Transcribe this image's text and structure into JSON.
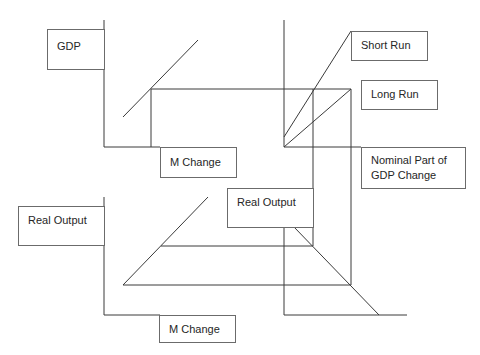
{
  "diagram": {
    "title": "",
    "stroke_color": "#3a3a3a",
    "box_border_color": "#6b6b6b",
    "labels": {
      "gdp": "GDP",
      "m_change_top": "M Change",
      "short_run": "Short Run",
      "long_run": "Long Run",
      "nominal_line1": "Nominal Part of",
      "nominal_line2": "GDP Change",
      "real_output_mid": "Real Output",
      "real_output_left": "Real Output",
      "m_change_bottom": "M Change"
    },
    "panels": [
      {
        "name": "top-left",
        "y_axis": "GDP",
        "x_axis": "M Change"
      },
      {
        "name": "top-right",
        "curves": [
          "Short Run",
          "Long Run"
        ],
        "x_axis": "Nominal Part of GDP Change"
      },
      {
        "name": "bottom-left",
        "y_axis": "Real Output",
        "x_axis": "M Change"
      },
      {
        "name": "bottom-right",
        "y_axis": "Real Output",
        "curve": "45-degree mapping"
      }
    ]
  }
}
